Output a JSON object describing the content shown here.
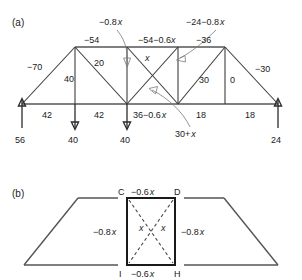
{
  "figure": {
    "panel_a_label": "(a)",
    "panel_b_label": "(b)"
  },
  "panel_a": {
    "top_chord_labels": [
      {
        "text": "−54"
      },
      {
        "text": "−54−0.6"
      },
      {
        "text": "x"
      },
      {
        "text": "−36"
      }
    ],
    "callout_left": {
      "text": "−0.8",
      "italic": "x"
    },
    "callout_right": {
      "text": "−24−0.8",
      "italic": "x"
    },
    "end_diagonal_left": "−70",
    "end_diagonal_right": "−30",
    "vertical_1": "40",
    "diagonal_2": "20",
    "diagonal_center_x": "x",
    "diagonal_right": "30",
    "vertical_right": "0",
    "bottom_chord_labels": [
      {
        "text": "42"
      },
      {
        "text": "42"
      },
      {
        "text": "36−0.6",
        "italic": "x"
      },
      {
        "text": "18"
      },
      {
        "text": "18"
      }
    ],
    "bottom_callout": {
      "text": "30+",
      "italic": "x"
    },
    "reactions": [
      {
        "value": "56",
        "dir": "up"
      },
      {
        "value": "40",
        "dir": "down"
      },
      {
        "value": "40",
        "dir": "down"
      },
      {
        "value": "24",
        "dir": "up"
      }
    ]
  },
  "panel_b": {
    "nodes": {
      "top_left": "C",
      "top_right": "D",
      "bottom_left": "I",
      "bottom_right": "H"
    },
    "top_label": {
      "text": "−0.6",
      "italic": "x"
    },
    "bottom_label": {
      "text": "−0.6",
      "italic": "x"
    },
    "left_outer_label": {
      "text": "−0.8",
      "italic": "x"
    },
    "right_outer_label": {
      "text": "−0.8",
      "italic": "x"
    },
    "diag_left_label": "x",
    "diag_right_label": "x"
  },
  "colors": {
    "stroke_member": "#3d3d3d",
    "stroke_chord": "#555555",
    "stroke_heavy": "#1a1a1a",
    "leader": "#7a7a7a",
    "text": "#1a1a1a",
    "background": "#ffffff"
  }
}
